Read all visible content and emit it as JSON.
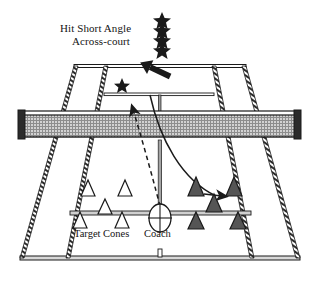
{
  "diagram": {
    "type": "tennis-court-drill",
    "title_line1": "Hit Short Angle",
    "title_line2": "Across-court",
    "difficulty": {
      "icon": "star-icon",
      "count": 4,
      "glyph": "★"
    },
    "labels": {
      "target_cones": "Target Cones",
      "coach": "Coach"
    },
    "colors": {
      "line": "#1a1a1a",
      "court_fill": "#ffffff",
      "net_mesh": "#b9b9b9",
      "net_frame": "#1a1a1a",
      "cone_light_fill": "#ffffff",
      "cone_dark_fill": "#555555",
      "hatch": "#2a2a2a",
      "text": "#141414",
      "background": "#ffffff"
    },
    "markers": {
      "target_star": {
        "icon": "star-icon",
        "glyph": "★",
        "x": 122,
        "y": 85
      },
      "racquet_arrow": {
        "icon": "arrow-down-left-icon",
        "x": 152,
        "y": 68
      },
      "ball_arrow_net": {
        "icon": "arrow-up-right-icon",
        "x": 133,
        "y": 101
      },
      "ball_arrow_target": {
        "icon": "arrow-right-icon",
        "x": 222,
        "y": 196
      }
    },
    "cones": {
      "light": [
        {
          "x": 88,
          "y": 190,
          "label": "near-left-cone-1"
        },
        {
          "x": 125,
          "y": 190,
          "label": "near-left-cone-2"
        },
        {
          "x": 105,
          "y": 208,
          "label": "near-left-cone-3"
        },
        {
          "x": 80,
          "y": 222,
          "label": "baseline-left-cone-1"
        },
        {
          "x": 122,
          "y": 222,
          "label": "baseline-left-cone-2"
        }
      ],
      "dark": [
        {
          "x": 196,
          "y": 190,
          "label": "near-right-cone-1"
        },
        {
          "x": 234,
          "y": 190,
          "label": "near-right-cone-2"
        },
        {
          "x": 214,
          "y": 206,
          "label": "near-right-cone-3"
        },
        {
          "x": 196,
          "y": 222,
          "label": "baseline-right-cone-1"
        },
        {
          "x": 238,
          "y": 222,
          "label": "baseline-right-cone-2"
        }
      ]
    },
    "coach_marker": {
      "icon": "coach-circle-icon",
      "x": 160,
      "y": 218,
      "rx": 11,
      "ry": 14
    },
    "ball_path": {
      "incoming_style": "dashed",
      "outgoing_style": "solid",
      "description": "dashed feed rising from coach over net, solid short-angle reply curving across-court to dark target cone"
    }
  }
}
